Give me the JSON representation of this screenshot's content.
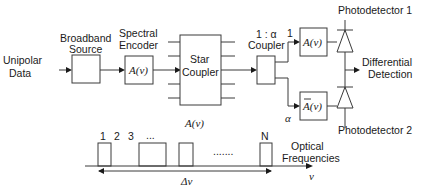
{
  "labels": {
    "input": [
      "Unipolar",
      "Data"
    ],
    "source": [
      "Broadband",
      "Source"
    ],
    "encoder": [
      "Spectral",
      "Encoder"
    ],
    "encoder_func": "A(ν)",
    "star": [
      "Star",
      "Coupler"
    ],
    "star_func": "A(ν)",
    "coupler_ratio": "1 : α",
    "coupler": "Coupler",
    "branch_top": "1",
    "branch_bottom": "α",
    "filter_top": "A(ν)",
    "filter_bottom": "A(ν)",
    "pd1": "Photodetector 1",
    "pd2": "Photodetector 2",
    "output": [
      "Differential",
      "Detection"
    ]
  },
  "spectrum": {
    "pulse_labels": [
      "1",
      "2",
      "3",
      "...",
      "N"
    ],
    "dots": ".......",
    "axis_label": [
      "Optical",
      "Frequencies"
    ],
    "axis_var": "ν",
    "bandwidth": "Δν"
  }
}
